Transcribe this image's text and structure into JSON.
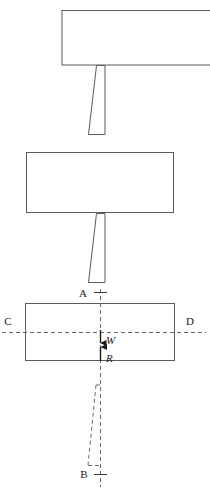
{
  "figure": {
    "kind": "free-body-diagram",
    "background_color": "#ffffff",
    "stroke_color": "#555555",
    "dash_color": "#666666",
    "text_color": "#1a1a1a",
    "width": 210,
    "height": 493
  },
  "labels": {
    "point_a": "A",
    "point_b": "B",
    "point_c": "C",
    "point_d": "D",
    "force_weight": "W",
    "force_reaction": "R"
  },
  "shapes": {
    "block_top": {
      "name": "top-block",
      "x": 62,
      "y": 10,
      "width": 148,
      "height": 55,
      "style": "solid",
      "clipped_right": true
    },
    "shear_top": {
      "name": "upper-shear-parallelogram",
      "top_left": 88,
      "top_right": 105,
      "bottom_left": 88,
      "bottom_right": 105,
      "y_top": 65,
      "y_bottom": 135,
      "skew": -8,
      "style": "solid"
    },
    "block_middle": {
      "name": "middle-block",
      "x": 26,
      "y": 152,
      "width": 148,
      "height": 61,
      "style": "solid"
    },
    "shear_middle": {
      "name": "lower-shear-parallelogram",
      "y_top": 213,
      "y_bottom": 283,
      "skew": -8,
      "style": "solid"
    },
    "block_bottom": {
      "name": "bottom-block",
      "x": 25,
      "y": 303,
      "width": 150,
      "height": 58,
      "style": "solid"
    },
    "shear_bottom": {
      "name": "dashed-shear-parallelogram",
      "y_top": 385,
      "y_bottom": 466,
      "skew": -8,
      "style": "dashed"
    }
  },
  "guides": {
    "vertical_axis": {
      "name": "vertical-centerline",
      "x": 100,
      "y_top": 289,
      "y_bottom": 487,
      "style": "dashed"
    },
    "horizontal_axis": {
      "name": "horizontal-centerline",
      "y": 332,
      "x_left": 2,
      "x_right": 205,
      "style": "dashed"
    },
    "tick_a": {
      "name": "tick-a",
      "x": 100,
      "y": 292
    },
    "tick_b": {
      "name": "tick-b",
      "x": 100,
      "y": 474
    }
  },
  "vectors": {
    "weight": {
      "name": "weight-vector",
      "symbol": "W",
      "direction": "down",
      "x": 100,
      "y_start": 330,
      "y_end": 343,
      "label_x": 106,
      "label_y": 342
    },
    "reaction": {
      "name": "reaction-vector",
      "symbol": "R",
      "direction": "up",
      "x": 100,
      "y_start": 361,
      "y_end": 347,
      "label_x": 106,
      "label_y": 359
    }
  }
}
